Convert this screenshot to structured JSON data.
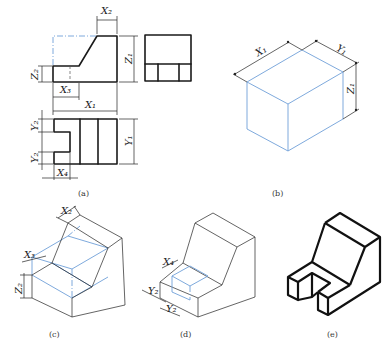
{
  "figure": {
    "panels": [
      {
        "id": "a",
        "caption": "(a)",
        "type": "orthographic-three-view",
        "dimensions": [
          "X2",
          "Z1",
          "Z2",
          "X3",
          "X1",
          "Y2",
          "Y1",
          "Y2",
          "X4"
        ]
      },
      {
        "id": "b",
        "caption": "(b)",
        "type": "bounding-box-isometric",
        "dimensions": [
          "X1",
          "Y1",
          "Z1"
        ]
      },
      {
        "id": "c",
        "caption": "(c)",
        "type": "isometric-step-cut",
        "dimensions": [
          "X2",
          "X3",
          "Z2"
        ]
      },
      {
        "id": "d",
        "caption": "(d)",
        "type": "isometric-slot-cut",
        "dimensions": [
          "X4",
          "Y2",
          "Y2"
        ]
      },
      {
        "id": "e",
        "caption": "(e)",
        "type": "isometric-final"
      }
    ],
    "labels": {
      "a": {
        "X2": "X₂",
        "Z1": "Z₁",
        "Z2": "Z₂",
        "X3": "X₃",
        "X1": "X₁",
        "Y2a": "Y₂",
        "Y1": "Y₁",
        "Y2b": "Y₂",
        "X4": "X₄"
      },
      "b": {
        "X1": "X₁",
        "Y1": "Y₁",
        "Z1": "Z₁"
      },
      "c": {
        "X2": "X₂",
        "X3": "X₃",
        "Z2": "Z₂"
      },
      "d": {
        "X4": "X₄",
        "Y2a": "Y₂",
        "Y2b": "Y₂"
      }
    },
    "colors": {
      "construction": "#6f9fd8",
      "outline": "#1a1a1a"
    }
  }
}
